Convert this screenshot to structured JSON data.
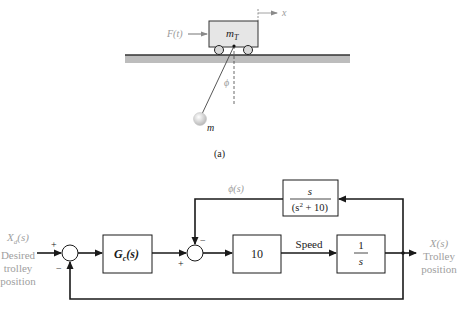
{
  "figure_a": {
    "caption": "(a)",
    "force_label": "F(t)",
    "cart_label_main": "m",
    "cart_label_sub": "T",
    "position_axis_label": "x",
    "angle_label": "ϕ",
    "pendulum_mass_label": "m",
    "colors": {
      "cart_fill": "#e6e6e6",
      "rail": "#b4b4b4",
      "rail_top": "#333333",
      "label_gray": "#9a9a9a"
    }
  },
  "figure_b": {
    "input": {
      "symbol": "X",
      "subscript": "d",
      "arg": "(s)",
      "line1": "Desired",
      "line2": "trolley",
      "line3": "position"
    },
    "output": {
      "symbol": "X(s)",
      "line1": "Trolley",
      "line2": "position"
    },
    "controller_block": {
      "label": "G",
      "subscript": "c",
      "arg": "(s)"
    },
    "gain_block": {
      "label": "10"
    },
    "integrator_block": {
      "numerator": "1",
      "denominator": "s"
    },
    "feedback_block": {
      "numerator": "s",
      "denominator_left": "(s",
      "denominator_exp": "2",
      "denominator_right": " + 10)"
    },
    "signal_labels": {
      "speed": "Speed",
      "phi": "ϕ(s)"
    },
    "sum1_signs": {
      "plus": "+",
      "minus": "−"
    },
    "sum2_signs": {
      "plus": "+",
      "minus": "−"
    }
  }
}
